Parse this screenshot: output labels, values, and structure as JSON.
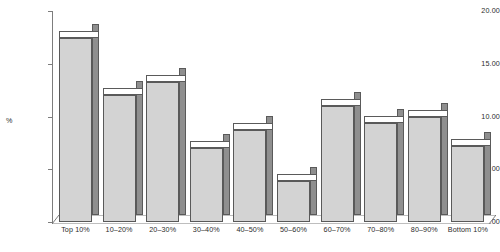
{
  "chart_data": {
    "type": "bar",
    "title": "",
    "xlabel": "",
    "ylabel": "%",
    "ylim": [
      0,
      20
    ],
    "ytick_labels": [
      "0.00",
      "5.00",
      "10.00",
      "15.00",
      "20.00"
    ],
    "ytick_values": [
      0,
      5,
      10,
      15,
      20
    ],
    "grid": false,
    "legend": "none",
    "style": "3d-column",
    "categories": [
      "Top 10%",
      "10–20%",
      "20–30%",
      "30–40%",
      "40–50%",
      "50–60%",
      "60–70%",
      "70–80%",
      "80–90%",
      "Bottom 10%"
    ],
    "values": [
      17.4,
      12.0,
      13.3,
      7.0,
      8.7,
      3.9,
      11.0,
      9.4,
      10.0,
      7.2
    ]
  },
  "axis": {
    "y_title": "%"
  },
  "caption": {
    "text": ""
  },
  "colors": {
    "bar_front": "#d3d3d3",
    "bar_side": "#8f8f8f",
    "bar_top": "#ffffff",
    "bar_outline": "#595959",
    "axis": "#7d7d7d",
    "text": "#2b2b2b"
  }
}
